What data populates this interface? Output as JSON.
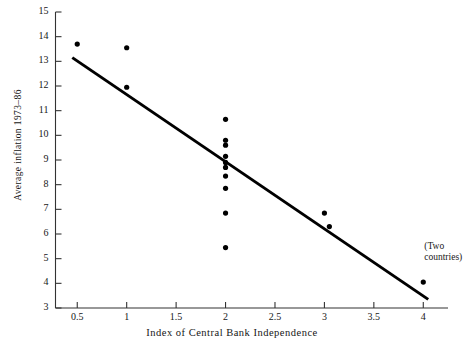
{
  "chart_data": {
    "type": "scatter",
    "title": "",
    "xlabel": "Index of Central Bank Independence",
    "ylabel": "Average inflation 1973–86",
    "xlim": [
      0.28,
      4.25
    ],
    "ylim": [
      3,
      15
    ],
    "xticks": [
      0.5,
      1,
      1.5,
      2,
      2.5,
      3,
      3.5,
      4
    ],
    "xticklabels": [
      "0.5",
      "1",
      "1.5",
      "2",
      "2.5",
      "3",
      "3.5",
      "4"
    ],
    "yticks": [
      3,
      4,
      5,
      6,
      7,
      8,
      9,
      10,
      11,
      12,
      13,
      14,
      15
    ],
    "yticklabels": [
      "3",
      "4",
      "5",
      "6",
      "7",
      "8",
      "9",
      "10",
      "11",
      "12",
      "13",
      "14",
      "15"
    ],
    "grid": false,
    "legend": null,
    "marker_color": "#000000",
    "line_color": "#000000",
    "axis_color": "#333333",
    "points": [
      {
        "x": 0.5,
        "y": 13.7
      },
      {
        "x": 1.0,
        "y": 13.55
      },
      {
        "x": 1.0,
        "y": 11.95
      },
      {
        "x": 2.0,
        "y": 10.65
      },
      {
        "x": 2.0,
        "y": 9.8
      },
      {
        "x": 2.0,
        "y": 9.6
      },
      {
        "x": 2.0,
        "y": 9.15
      },
      {
        "x": 2.0,
        "y": 8.9
      },
      {
        "x": 2.0,
        "y": 8.7
      },
      {
        "x": 2.0,
        "y": 8.35
      },
      {
        "x": 2.0,
        "y": 7.85
      },
      {
        "x": 2.0,
        "y": 6.85
      },
      {
        "x": 2.0,
        "y": 5.45
      },
      {
        "x": 3.0,
        "y": 6.85
      },
      {
        "x": 3.05,
        "y": 6.3
      },
      {
        "x": 4.0,
        "y": 4.05
      }
    ],
    "trend_line": {
      "x0": 0.45,
      "y0": 13.15,
      "x1": 4.05,
      "y1": 3.35,
      "width_px": 3
    },
    "annotations": [
      {
        "text": "(Two",
        "x": 4.02,
        "y": 5.45
      },
      {
        "text": "countries)",
        "x": 4.02,
        "y": 5.0
      }
    ]
  }
}
